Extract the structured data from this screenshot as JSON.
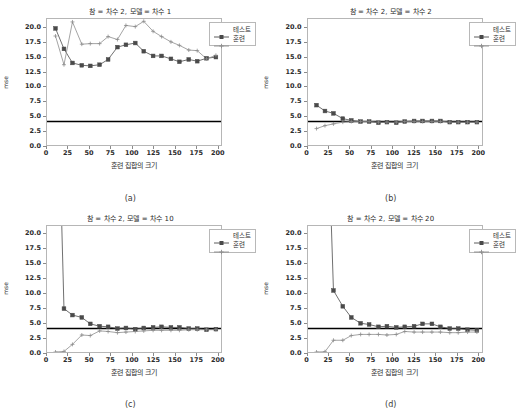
{
  "figure": {
    "width": 521,
    "height": 413,
    "background": "#ffffff",
    "colors": {
      "test_series": "#4a4a4a",
      "train_series": "#8c8c8c",
      "baseline": "#000000",
      "axis": "#b6b6b6",
      "text": "#2b2b2b"
    }
  },
  "common": {
    "xlabel": "훈련 집합의 크기",
    "ylabel": "mse",
    "xticks": [
      0,
      25,
      50,
      75,
      100,
      125,
      150,
      175,
      200
    ],
    "yticks": [
      "0.0",
      "2.5",
      "5.0",
      "7.5",
      "10.0",
      "12.5",
      "15.0",
      "17.5",
      "20.0"
    ],
    "legend": {
      "test_label": "테스트",
      "train_label": "훈련"
    }
  },
  "chart_data": [
    {
      "type": "line",
      "panel": "a",
      "caption": "(a)",
      "title": "참 = 차수 2, 모델 = 차수 1",
      "xlabel": "훈련 집합의 크기",
      "ylabel": "mse",
      "xlim": [
        0,
        205
      ],
      "ylim": [
        0,
        21.5
      ],
      "grid": false,
      "legend_position": "upper right",
      "baseline_y": 4.0,
      "x": [
        10,
        20,
        30,
        41,
        51,
        62,
        72,
        83,
        93,
        104,
        114,
        125,
        135,
        146,
        156,
        167,
        177,
        188,
        199
      ],
      "series": [
        {
          "name": "테스트",
          "marker": "square",
          "values": [
            19.9,
            16.4,
            14.0,
            13.6,
            13.5,
            13.7,
            14.6,
            16.7,
            17.1,
            17.4,
            16.0,
            15.2,
            15.2,
            14.7,
            14.2,
            14.6,
            14.3,
            14.8,
            15.0
          ]
        },
        {
          "name": "훈련",
          "marker": "x",
          "values": [
            18.6,
            13.7,
            21.0,
            17.2,
            17.3,
            17.3,
            18.5,
            18.0,
            20.4,
            20.2,
            21.1,
            19.4,
            18.5,
            17.6,
            17.0,
            16.2,
            16.1,
            14.7,
            15.3
          ]
        }
      ]
    },
    {
      "type": "line",
      "panel": "b",
      "caption": "(b)",
      "title": "참 = 차수 2, 모델 = 차수 2",
      "xlabel": "훈련 집합의 크기",
      "ylabel": "mse",
      "xlim": [
        0,
        205
      ],
      "ylim": [
        0,
        21.5
      ],
      "grid": false,
      "legend_position": "upper right",
      "baseline_y": 4.0,
      "x": [
        10,
        20,
        30,
        41,
        51,
        62,
        72,
        83,
        93,
        104,
        114,
        125,
        135,
        146,
        156,
        167,
        177,
        188,
        199
      ],
      "series": [
        {
          "name": "테스트",
          "marker": "square",
          "values": [
            6.8,
            5.8,
            5.4,
            4.5,
            4.2,
            4.0,
            4.0,
            3.8,
            3.9,
            3.8,
            4.0,
            4.1,
            4.1,
            4.1,
            4.1,
            3.9,
            3.9,
            3.9,
            3.9
          ]
        },
        {
          "name": "훈련",
          "marker": "x",
          "values": [
            2.8,
            3.3,
            3.6,
            3.9,
            4.0,
            4.0,
            4.0,
            3.9,
            3.9,
            3.9,
            4.0,
            4.0,
            4.0,
            4.0,
            4.0,
            3.9,
            3.9,
            3.9,
            3.9
          ]
        }
      ]
    },
    {
      "type": "line",
      "panel": "c",
      "caption": "(c)",
      "title": "참 = 차수 2, 모델 = 차수 10",
      "xlabel": "훈련 집합의 크기",
      "ylabel": "mse",
      "xlim": [
        0,
        205
      ],
      "ylim": [
        0,
        21.5
      ],
      "grid": false,
      "legend_position": "upper right",
      "baseline_y": 4.0,
      "x": [
        10,
        20,
        30,
        41,
        51,
        62,
        72,
        83,
        93,
        104,
        114,
        125,
        135,
        146,
        156,
        167,
        177,
        188,
        199
      ],
      "series": [
        {
          "name": "테스트",
          "marker": "square",
          "values": [
            62.0,
            7.4,
            6.3,
            5.9,
            4.8,
            4.4,
            4.3,
            4.0,
            4.1,
            3.9,
            4.1,
            4.2,
            4.3,
            4.2,
            4.2,
            4.0,
            4.0,
            3.8,
            3.9
          ]
        },
        {
          "name": "훈련",
          "marker": "x",
          "values": [
            0.0,
            0.1,
            1.3,
            2.9,
            2.8,
            3.6,
            3.5,
            3.3,
            3.4,
            3.5,
            3.6,
            3.7,
            3.7,
            3.7,
            3.7,
            3.8,
            3.8,
            3.8,
            3.8
          ]
        }
      ]
    },
    {
      "type": "line",
      "panel": "d",
      "caption": "(d)",
      "title": "참 = 차수 2, 모델 = 차수 20",
      "xlabel": "훈련 집합의 크기",
      "ylabel": "mse",
      "xlim": [
        0,
        205
      ],
      "ylim": [
        0,
        21.5
      ],
      "grid": false,
      "legend_position": "upper right",
      "baseline_y": 4.0,
      "x": [
        10,
        20,
        30,
        41,
        51,
        62,
        72,
        83,
        93,
        104,
        114,
        125,
        135,
        146,
        156,
        167,
        177,
        188,
        199
      ],
      "series": [
        {
          "name": "테스트",
          "marker": "square",
          "values": [
            70.0,
            55.0,
            10.5,
            7.8,
            5.9,
            4.9,
            4.7,
            4.3,
            4.4,
            4.2,
            4.3,
            4.4,
            4.8,
            4.8,
            4.3,
            4.0,
            4.0,
            3.8,
            3.7
          ]
        },
        {
          "name": "훈련",
          "marker": "x",
          "values": [
            0.0,
            0.05,
            2.0,
            2.0,
            2.8,
            3.0,
            3.0,
            3.0,
            2.9,
            3.0,
            3.5,
            3.4,
            3.4,
            3.4,
            3.4,
            3.3,
            3.3,
            3.4,
            3.4
          ]
        }
      ]
    }
  ]
}
